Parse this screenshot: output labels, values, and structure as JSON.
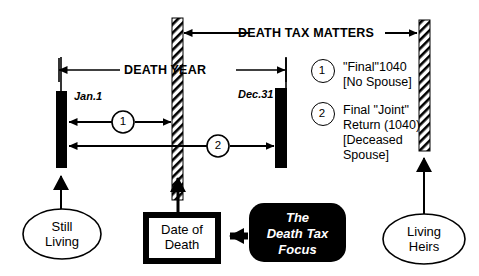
{
  "diagram": {
    "colors": {
      "ink": "#000000",
      "paper": "#ffffff",
      "focus_box_fill": "#000000",
      "focus_box_text": "#ffffff"
    },
    "top_arrow": {
      "label": "DEATH TAX MATTERS"
    },
    "span_arrow": {
      "label": "DEATH YEAR"
    },
    "year_markers": {
      "start": "Jan.1",
      "end": "Dec.31"
    },
    "inline_markers": [
      {
        "number": "1"
      },
      {
        "number": "2"
      }
    ],
    "legend": [
      {
        "number": "1",
        "line1": "\"Final\"1040",
        "line2": "[No Spouse]",
        "line3": "",
        "line4": ""
      },
      {
        "number": "2",
        "line1": "Final \"Joint\"",
        "line2": "Return (1040)",
        "line3": "[Deceased",
        "line4": "Spouse]"
      }
    ],
    "nodes": {
      "still_living": {
        "line1": "Still",
        "line2": "Living"
      },
      "date_of_death": {
        "line1": "Date of",
        "line2": "Death"
      },
      "living_heirs": {
        "line1": "Living",
        "line2": "Heirs"
      },
      "focus": {
        "line1": "The",
        "line2": "Death  Tax",
        "line3": "Focus"
      }
    }
  }
}
